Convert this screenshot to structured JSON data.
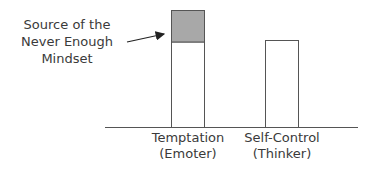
{
  "annotation": {
    "lines": [
      "Source of the",
      "Never Enough",
      "Mindset"
    ]
  },
  "categories": [
    {
      "label": "Temptation",
      "sublabel": "(Emoter)"
    },
    {
      "label": "Self-Control",
      "sublabel": "(Thinker)"
    }
  ],
  "colors": {
    "highlight_fill": "#a8a8a8",
    "bar_fill": "#ffffff",
    "stroke": "#555555"
  }
}
